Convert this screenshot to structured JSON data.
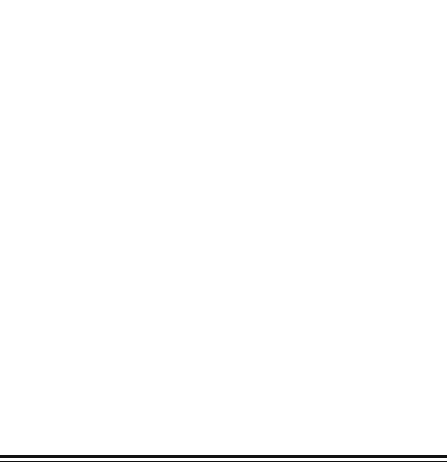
{
  "figure": {
    "panel_label": "(b)"
  },
  "chart_data": [
    {
      "id": "top",
      "type": "line",
      "title": "",
      "panel": "(b)",
      "xlabel": "Number of Rounds",
      "ylabel": "Objective Throughput",
      "x": [
        50,
        100,
        150,
        200,
        250,
        300,
        350,
        400,
        450,
        500
      ],
      "xlim": [
        30,
        520
      ],
      "ylim": [
        194,
        231
      ],
      "xticks": [
        100,
        200,
        300,
        400,
        500
      ],
      "yticks": [
        195,
        200,
        205,
        210,
        215,
        220,
        225,
        230
      ],
      "grid": false,
      "legend_position": "top-right",
      "series": [
        {
          "name": "CMPS",
          "marker": "square",
          "linestyle": "solid",
          "values": [
            228.0,
            225.0,
            223.3,
            220.3,
            215.2,
            212.5,
            208.4,
            205.4,
            203.4,
            202.5
          ]
        },
        {
          "name": "CPS",
          "marker": "triangle",
          "linestyle": "dashed",
          "values": [
            221.2,
            219.3,
            215.2,
            212.3,
            208.3,
            205.5,
            202.4,
            201.6,
            199.4,
            198.6
          ]
        },
        {
          "name": "FMPS",
          "marker": "circle",
          "linestyle": "dotted",
          "values": [
            217.0,
            217.1,
            217.2,
            216.2,
            215.2,
            213.4,
            211.2,
            208.3,
            205.4,
            200.5
          ]
        }
      ]
    },
    {
      "id": "bottom",
      "type": "line",
      "title": "",
      "xlabel": "Number of Rounds",
      "ylabel": "Fitness Evaluations",
      "x": [
        0,
        50,
        100,
        150,
        200,
        250,
        300,
        350,
        400,
        450,
        500
      ],
      "xlim": [
        -25,
        525
      ],
      "ylim": [
        -0.6,
        13.2
      ],
      "xticks": [
        0,
        100,
        200,
        300,
        400,
        500
      ],
      "yticks": [
        0,
        2,
        4,
        6,
        8,
        10,
        12
      ],
      "grid": false,
      "legend_position": "top-left",
      "series": [
        {
          "name": "CMPS",
          "marker": "dot",
          "linestyle": "solid",
          "values": [
            0.0,
            1.45,
            2.5,
            3.85,
            5.1,
            6.2,
            7.3,
            8.6,
            9.85,
            11.15,
            12.6
          ]
        },
        {
          "name": "CPS",
          "marker": "triangle",
          "linestyle": "solid",
          "values": [
            0.0,
            1.45,
            2.5,
            3.85,
            5.1,
            6.2,
            7.3,
            8.6,
            9.85,
            11.15,
            12.6
          ]
        },
        {
          "name": "FMPS",
          "marker": "square",
          "linestyle": "solid",
          "values": [
            0.0,
            1.45,
            2.5,
            3.85,
            5.1,
            6.2,
            7.3,
            8.6,
            9.85,
            11.15,
            12.6
          ]
        }
      ]
    }
  ]
}
